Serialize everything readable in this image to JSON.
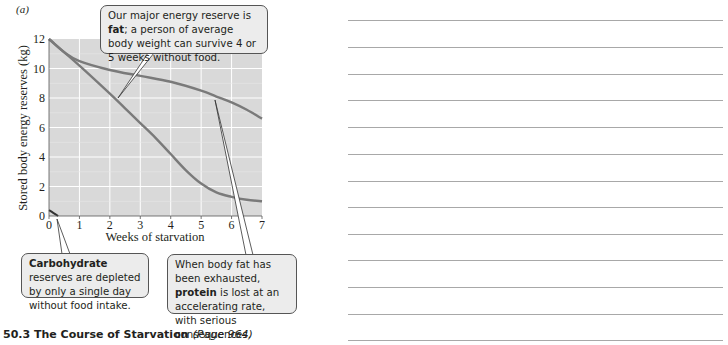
{
  "panel_label": "(a)",
  "chart_data": {
    "type": "line",
    "title": "",
    "xlabel": "Weeks of starvation",
    "ylabel": "Stored body energy reserves (kg)",
    "xlim": [
      0,
      7
    ],
    "ylim": [
      0,
      12
    ],
    "x_ticks": [
      "0",
      "1",
      "2",
      "3",
      "4",
      "5",
      "6",
      "7"
    ],
    "y_ticks": [
      "0",
      "2",
      "4",
      "6",
      "8",
      "10",
      "12"
    ],
    "grid": true,
    "background": "#d9d9d9",
    "series": [
      {
        "name": "Fat",
        "color": "#7a7a7a",
        "x": [
          0,
          0.5,
          1,
          2,
          3,
          4,
          5,
          5.5,
          6,
          6.5,
          7
        ],
        "y": [
          12,
          11.1,
          10.5,
          9.9,
          9.5,
          9.1,
          8.5,
          8.1,
          7.7,
          7.2,
          6.6
        ]
      },
      {
        "name": "Protein",
        "color": "#7a7a7a",
        "x": [
          0,
          1,
          2,
          2.5,
          3,
          3.5,
          4,
          4.5,
          5,
          5.5,
          6,
          6.5,
          7
        ],
        "y": [
          12,
          10.2,
          8.3,
          7.3,
          6.3,
          5.3,
          4.2,
          3.1,
          2.2,
          1.6,
          1.3,
          1.1,
          1.0
        ]
      },
      {
        "name": "Carbohydrate",
        "color": "#333333",
        "x": [
          0,
          0.15,
          0.3
        ],
        "y": [
          0.4,
          0.2,
          0.0
        ]
      }
    ],
    "annotations": [
      {
        "target": "Fat",
        "text_parts": [
          {
            "t": "Our major energy reserve is ",
            "b": false
          },
          {
            "t": "fat",
            "b": true
          },
          {
            "t": "; a person of average body weight can survive 4 or 5 weeks without food.",
            "b": false
          }
        ]
      },
      {
        "target": "Carbohydrate",
        "text_parts": [
          {
            "t": "Carbohydrate",
            "b": true
          },
          {
            "t": " reserves are depleted by only a single day without food intake.",
            "b": false
          }
        ]
      },
      {
        "target": "Protein",
        "text_parts": [
          {
            "t": "When body fat has been exhausted, ",
            "b": false
          },
          {
            "t": "protein",
            "b": true
          },
          {
            "t": " is lost at an accelerating rate, with serious consequences.",
            "b": false
          }
        ]
      }
    ]
  },
  "callouts": {
    "fat": {
      "pre": "Our major energy reserve is ",
      "bold": "fat",
      "post": "; a person of average body weight can survive 4 or 5 weeks without food."
    },
    "carbohydrate": {
      "pre": "",
      "bold": "Carbohydrate",
      "post": " reserves are depleted by only a single day without food intake."
    },
    "protein": {
      "pre": "When body fat has been exhausted, ",
      "bold": "protein",
      "post": " is lost at an accelerating rate, with serious consequences."
    }
  },
  "caption": {
    "title": "50.3  The Course of Starvation",
    "page": "(Page 964)"
  },
  "notes": {
    "line_count": 13
  }
}
